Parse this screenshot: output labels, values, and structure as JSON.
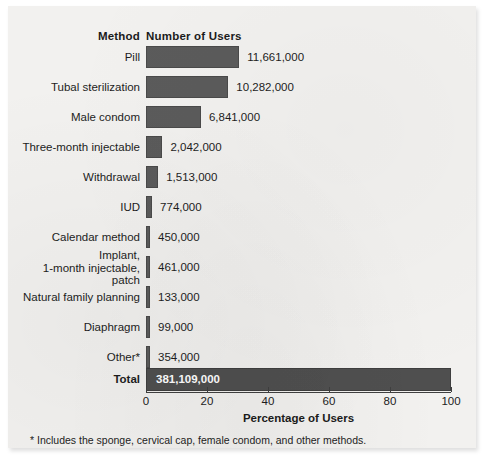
{
  "figure": {
    "header_method": "Method",
    "header_users": "Number of Users",
    "footnote": "* Includes the sponge, cervical cap, female condom, and other methods.",
    "bar_color": "#5b5b5b",
    "total_bar_color": "#4f4f4f",
    "panel_color": "#f2f1ef"
  },
  "chart_data": {
    "type": "bar",
    "orientation": "horizontal",
    "title": "",
    "xlabel": "Percentage of Users",
    "ylabel": "Method",
    "xlim": [
      0,
      100
    ],
    "xticks": [
      0,
      20,
      40,
      60,
      80,
      100
    ],
    "xtick_labels": [
      "0",
      "20",
      "40",
      "60",
      "80",
      "100"
    ],
    "grid": false,
    "legend": false,
    "value_column_header": "Number of Users",
    "categories": [
      "Pill",
      "Tubal sterilization",
      "Male condom",
      "Three-month injectable",
      "Withdrawal",
      "IUD",
      "Calendar method",
      "Implant,\n1-month injectable,\npatch",
      "Natural family planning",
      "Diaphragm",
      "Other*",
      "Total"
    ],
    "values": [
      11661000,
      10282000,
      6841000,
      2042000,
      1513000,
      774000,
      450000,
      461000,
      133000,
      99000,
      354000,
      381109000
    ],
    "value_labels": [
      "11,661,000",
      "10,282,000",
      "6,841,000",
      "2,042,000",
      "1,513,000",
      "774,000",
      "450,000",
      "461,000",
      "133,000",
      "99,000",
      "354,000",
      "381,109,000"
    ],
    "percentages": [
      30.6,
      27.0,
      18.0,
      5.4,
      4.0,
      2.0,
      1.2,
      1.2,
      0.35,
      0.26,
      0.93,
      100.0
    ]
  },
  "rows": [
    {
      "label": "Pill",
      "label_lines": [
        "Pill"
      ],
      "value_label": "11,661,000",
      "pct": 30.6,
      "y": 40,
      "h": 22,
      "label_y": 45,
      "is_total": false,
      "value_inside": false
    },
    {
      "label": "Tubal sterilization",
      "label_lines": [
        "Tubal sterilization"
      ],
      "value_label": "10,282,000",
      "pct": 27.0,
      "y": 70,
      "h": 22,
      "label_y": 75,
      "is_total": false,
      "value_inside": false
    },
    {
      "label": "Male condom",
      "label_lines": [
        "Male condom"
      ],
      "value_label": "6,841,000",
      "pct": 18.0,
      "y": 100,
      "h": 22,
      "label_y": 105,
      "is_total": false,
      "value_inside": false
    },
    {
      "label": "Three-month injectable",
      "label_lines": [
        "Three-month injectable"
      ],
      "value_label": "2,042,000",
      "pct": 5.4,
      "y": 130,
      "h": 22,
      "label_y": 135,
      "is_total": false,
      "value_inside": false
    },
    {
      "label": "Withdrawal",
      "label_lines": [
        "Withdrawal"
      ],
      "value_label": "1,513,000",
      "pct": 4.0,
      "y": 160,
      "h": 22,
      "label_y": 165,
      "is_total": false,
      "value_inside": false
    },
    {
      "label": "IUD",
      "label_lines": [
        "IUD"
      ],
      "value_label": "774,000",
      "pct": 2.0,
      "y": 190,
      "h": 22,
      "label_y": 195,
      "is_total": false,
      "value_inside": false
    },
    {
      "label": "Calendar method",
      "label_lines": [
        "Calendar method"
      ],
      "value_label": "450,000",
      "pct": 1.2,
      "y": 220,
      "h": 22,
      "label_y": 225,
      "is_total": false,
      "value_inside": false
    },
    {
      "label": "Implant, 1-month injectable, patch",
      "label_lines": [
        "Implant,",
        "1-month injectable,",
        "patch"
      ],
      "value_label": "461,000",
      "pct": 1.2,
      "y": 250,
      "h": 22,
      "label_y": 243,
      "is_total": false,
      "value_inside": false
    },
    {
      "label": "Natural family planning",
      "label_lines": [
        "Natural family planning"
      ],
      "value_label": "133,000",
      "pct": 0.55,
      "y": 280,
      "h": 22,
      "label_y": 285,
      "is_total": false,
      "value_inside": false
    },
    {
      "label": "Diaphragm",
      "label_lines": [
        "Diaphragm"
      ],
      "value_label": "99,000",
      "pct": 0.5,
      "y": 310,
      "h": 22,
      "label_y": 315,
      "is_total": false,
      "value_inside": false
    },
    {
      "label": "Other*",
      "label_lines": [
        "Other*"
      ],
      "value_label": "354,000",
      "pct": 0.75,
      "y": 340,
      "h": 22,
      "label_y": 345,
      "is_total": false,
      "value_inside": false
    },
    {
      "label": "Total",
      "label_lines": [
        "Total"
      ],
      "value_label": "381,109,000",
      "pct": 100.0,
      "y": 362,
      "h": 23,
      "label_y": 367,
      "is_total": true,
      "value_inside": true
    }
  ],
  "axis": {
    "ticks": [
      {
        "label": "0",
        "pct": 0
      },
      {
        "label": "20",
        "pct": 20
      },
      {
        "label": "40",
        "pct": 40
      },
      {
        "label": "60",
        "pct": 60
      },
      {
        "label": "80",
        "pct": 80
      },
      {
        "label": "100",
        "pct": 100
      }
    ],
    "xlabel": "Percentage of Users"
  }
}
